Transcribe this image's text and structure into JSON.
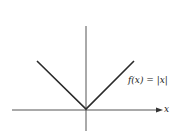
{
  "diagram": {
    "function_label": "f(x) = |x|",
    "x_axis_label": "x",
    "colors": {
      "line": "#2a2a2a",
      "axis": "#333333",
      "background": "#ffffff"
    }
  }
}
